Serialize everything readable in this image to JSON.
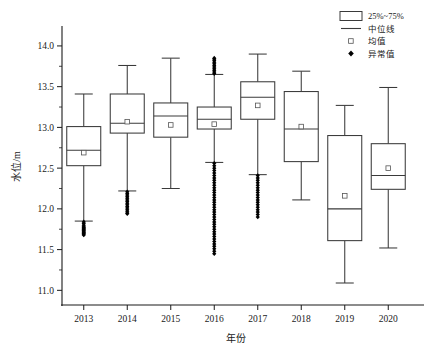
{
  "chart_data": {
    "type": "box",
    "title": "",
    "xlabel": "年份",
    "ylabel": "水位/m",
    "xlim": [
      2012.5,
      2020.5
    ],
    "ylim": [
      10.82,
      14.22
    ],
    "grid": false,
    "categories": [
      "2013",
      "2014",
      "2015",
      "2016",
      "2017",
      "2018",
      "2019",
      "2020"
    ],
    "ytick_labels": [
      "11.0",
      "11.5",
      "12.0",
      "12.5",
      "13.0",
      "13.5",
      "14.0"
    ],
    "ytick_values": [
      11.0,
      11.5,
      12.0,
      12.5,
      13.0,
      13.5,
      14.0
    ],
    "yminor_values": [
      11.25,
      11.75,
      12.25,
      12.75,
      13.25,
      13.75
    ],
    "boxes": [
      {
        "category": "2013",
        "whisker_low": 11.85,
        "q1": 12.53,
        "median": 12.72,
        "q3": 13.01,
        "whisker_high": 13.41,
        "mean": 12.69,
        "outliers": [
          11.84,
          11.82,
          11.8,
          11.78,
          11.77,
          11.76,
          11.75,
          11.74,
          11.73,
          11.72,
          11.71,
          11.7,
          11.69,
          11.68
        ]
      },
      {
        "category": "2014",
        "whisker_low": 12.22,
        "q1": 12.93,
        "median": 13.05,
        "q3": 13.41,
        "whisker_high": 13.76,
        "mean": 13.07,
        "outliers": [
          12.21,
          12.19,
          12.17,
          12.15,
          12.13,
          12.11,
          12.09,
          12.07,
          12.05,
          12.03,
          12.01,
          11.99,
          11.97,
          11.95,
          11.94
        ]
      },
      {
        "category": "2015",
        "whisker_low": 12.25,
        "q1": 12.88,
        "median": 13.14,
        "q3": 13.3,
        "whisker_high": 13.85,
        "mean": 13.03,
        "outliers": []
      },
      {
        "category": "2016",
        "whisker_low": 12.57,
        "q1": 12.98,
        "median": 13.1,
        "q3": 13.25,
        "whisker_high": 13.65,
        "mean": 13.04,
        "outliers": [
          13.85,
          13.84,
          13.82,
          13.8,
          13.78,
          13.76,
          13.74,
          13.72,
          13.7,
          13.68,
          13.66,
          12.56,
          12.53,
          12.5,
          12.47,
          12.44,
          12.41,
          12.38,
          12.35,
          12.32,
          12.29,
          12.26,
          12.23,
          12.2,
          12.17,
          12.14,
          12.11,
          12.08,
          12.05,
          12.02,
          11.99,
          11.96,
          11.93,
          11.9,
          11.87,
          11.84,
          11.81,
          11.78,
          11.75,
          11.72,
          11.69,
          11.66,
          11.63,
          11.6,
          11.57,
          11.54,
          11.51,
          11.48,
          11.45
        ]
      },
      {
        "category": "2017",
        "whisker_low": 12.42,
        "q1": 13.1,
        "median": 13.37,
        "q3": 13.56,
        "whisker_high": 13.9,
        "mean": 13.27,
        "outliers": [
          12.41,
          12.38,
          12.35,
          12.32,
          12.29,
          12.26,
          12.23,
          12.2,
          12.17,
          12.14,
          12.11,
          12.08,
          12.05,
          12.02,
          11.99,
          11.96,
          11.93,
          11.9
        ]
      },
      {
        "category": "2018",
        "whisker_low": 12.11,
        "q1": 12.58,
        "median": 12.98,
        "q3": 13.44,
        "whisker_high": 13.69,
        "mean": 13.01,
        "outliers": []
      },
      {
        "category": "2019",
        "whisker_low": 11.09,
        "q1": 11.61,
        "median": 12.0,
        "q3": 12.9,
        "whisker_high": 13.27,
        "mean": 12.16,
        "outliers": []
      },
      {
        "category": "2020",
        "whisker_low": 11.52,
        "q1": 12.24,
        "median": 12.41,
        "q3": 12.8,
        "whisker_high": 13.49,
        "mean": 12.5,
        "outliers": []
      }
    ]
  },
  "legend": {
    "position": "top-right",
    "items": [
      {
        "label": "25%~75%",
        "marker": "box"
      },
      {
        "label": "中位线",
        "marker": "line"
      },
      {
        "label": "均值",
        "marker": "square"
      },
      {
        "label": "异常值",
        "marker": "diamond"
      }
    ]
  },
  "colors": {
    "axis": "#1a1a1a",
    "box_stroke": "#3a3a3a",
    "box_fill": "#ffffff",
    "outlier": "#000000",
    "background": "#ffffff"
  }
}
